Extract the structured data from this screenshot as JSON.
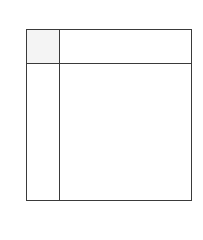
{
  "diagram": {
    "type": "grid",
    "rows": 2,
    "columns": 2,
    "colors": {
      "line": "#3a3a3a",
      "corner_fill": "#f4f4f4",
      "cell_fill": "#ffffff",
      "background": "#ffffff"
    },
    "cells": {
      "corner": "",
      "column_header": "",
      "row_header": "",
      "body": ""
    }
  }
}
